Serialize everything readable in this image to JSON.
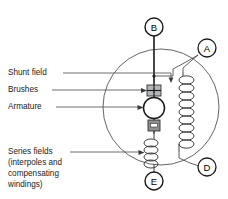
{
  "figure": {
    "kind": "electrical-schematic",
    "background_color": "#ffffff",
    "line_color": "#1a1a1a"
  },
  "labels": [
    {
      "id": "shunt-field",
      "text": "Shunt field"
    },
    {
      "id": "brushes",
      "text": "Brushes"
    },
    {
      "id": "armature",
      "text": "Armature"
    },
    {
      "id": "series-fields-1",
      "text": "Series fields"
    },
    {
      "id": "series-fields-2",
      "text": "(interpoles and"
    },
    {
      "id": "series-fields-3",
      "text": "compensating"
    },
    {
      "id": "series-fields-4",
      "text": "windings)"
    }
  ],
  "terminals": [
    {
      "id": "terminal-b",
      "text": "B",
      "position": "top"
    },
    {
      "id": "terminal-a",
      "text": "A",
      "position": "upper-right"
    },
    {
      "id": "terminal-d",
      "text": "D",
      "position": "lower-right"
    },
    {
      "id": "terminal-e",
      "text": "E",
      "position": "bottom"
    }
  ],
  "brushes": [
    {
      "id": "brush-positive",
      "sign": "+",
      "fill": "#b5b5b5"
    },
    {
      "id": "brush-negative",
      "sign": "–",
      "fill": "#8f8f8f"
    }
  ],
  "components": {
    "armature": {
      "id": "armature-circle",
      "label": "Armature"
    },
    "shunt_field_coil": {
      "id": "shunt-field-coil",
      "turns": 9
    },
    "series_field_coil": {
      "id": "series-field-coil",
      "turns": 4
    },
    "housing": {
      "id": "motor-housing-circle"
    }
  },
  "colors": {
    "brush_plus": "#b5b5b5",
    "brush_minus": "#8f8f8f",
    "housing_stroke": "#555555",
    "wire_stroke": "#1a1a1a",
    "leader_stroke": "#4a4a4a",
    "text": "#1a1a1a"
  }
}
